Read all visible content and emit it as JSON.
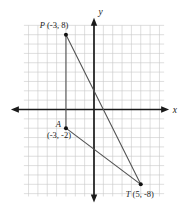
{
  "figure": {
    "colors": {
      "background": "#ffffff",
      "grid": "#c7c7c7",
      "axis": "#1a1a1a",
      "segment": "#4f4f4f",
      "point": "#111111",
      "text": "#1a1a1a"
    }
  },
  "chart_data": {
    "type": "scatter",
    "title": "",
    "xlabel": "x",
    "ylabel": "y",
    "grid": true,
    "grid_step": 1,
    "xlim": [
      -7.5,
      7.5
    ],
    "ylim": [
      -9.3,
      9
    ],
    "points": [
      {
        "name": "P",
        "x": -3,
        "y": 8,
        "letter": "P",
        "coords_text": "(-3, 8)",
        "label_layout": "above"
      },
      {
        "name": "A",
        "x": -3,
        "y": -2,
        "letter": "A",
        "coords_text": "(-3, -2)",
        "label_layout": "left-coords-below"
      },
      {
        "name": "T",
        "x": 5,
        "y": -8,
        "letter": "T",
        "coords_text": "(5, -8)",
        "label_layout": "below"
      }
    ],
    "segments": [
      [
        "P",
        "A"
      ],
      [
        "P",
        "T"
      ],
      [
        "A",
        "T"
      ]
    ]
  }
}
